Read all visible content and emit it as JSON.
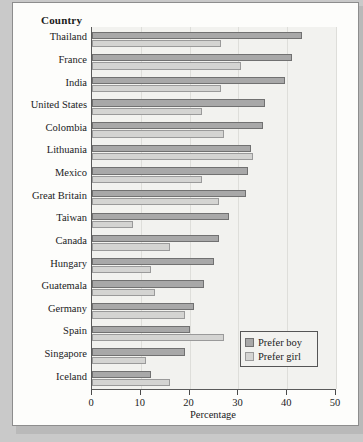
{
  "chart_data": {
    "type": "bar",
    "orientation": "horizontal",
    "title": "",
    "xlabel": "Percentage",
    "ylabel": "Country",
    "xlim": [
      0,
      50
    ],
    "xticks": [
      0,
      10,
      20,
      30,
      40,
      50
    ],
    "xtick_labels": [
      "0",
      "10",
      "20",
      "30",
      "40",
      "50"
    ],
    "grid": true,
    "legend_position": "lower right",
    "categories": [
      "Thailand",
      "France",
      "India",
      "United States",
      "Colombia",
      "Lithuania",
      "Mexico",
      "Great Britain",
      "Taiwan",
      "Canada",
      "Hungary",
      "Guatemala",
      "Germany",
      "Spain",
      "Singapore",
      "Iceland"
    ],
    "series": [
      {
        "name": "Prefer boy",
        "color": "#a8a8a8",
        "values": [
          43,
          41,
          39.5,
          35.5,
          35,
          32.5,
          32,
          31.5,
          28,
          26,
          25,
          23,
          21,
          20,
          19,
          12
        ]
      },
      {
        "name": "Prefer girl",
        "color": "#d4d4d2",
        "values": [
          26.5,
          30.5,
          26.5,
          22.5,
          27,
          33,
          22.5,
          26,
          8.5,
          16,
          12,
          13,
          19,
          27,
          11,
          16
        ]
      }
    ]
  },
  "axis": {
    "y_axis_title": "Country",
    "x_axis_title": "Percentage"
  },
  "legend": {
    "items": [
      {
        "label": "Prefer boy"
      },
      {
        "label": "Prefer girl"
      }
    ]
  }
}
